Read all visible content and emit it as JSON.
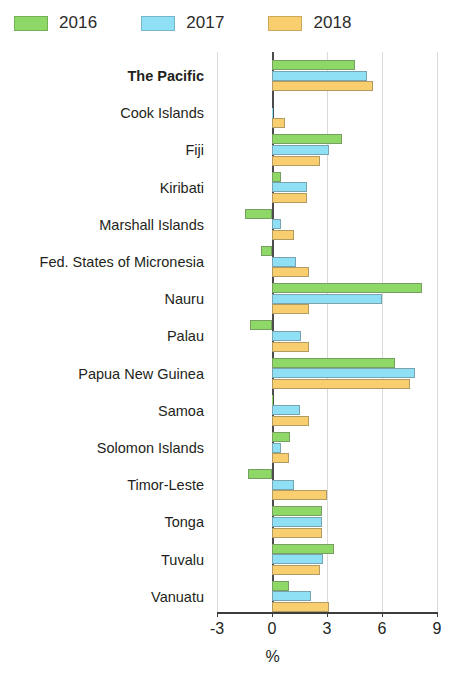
{
  "chart_data": {
    "type": "bar",
    "orientation": "horizontal",
    "title": "",
    "subtitle": "",
    "xlabel": "%",
    "ylabel": "",
    "xlim": [
      -3,
      9
    ],
    "xticks": [
      -3,
      0,
      3,
      6,
      9
    ],
    "xtick_labels": [
      "-3",
      "0",
      "3",
      "6",
      "9"
    ],
    "grid": true,
    "grid_axis": "x",
    "legend_position": "top-left",
    "emphasized_category": "The Pacific",
    "categories": [
      "The Pacific",
      "Cook Islands",
      "Fiji",
      "Kiribati",
      "Marshall Islands",
      "Fed. States of Micronesia",
      "Nauru",
      "Palau",
      "Papua New Guinea",
      "Samoa",
      "Solomon Islands",
      "Timor-Leste",
      "Tonga",
      "Tuvalu",
      "Vanuatu"
    ],
    "series": [
      {
        "name": "2016",
        "color": "#8DD867",
        "values": [
          4.5,
          0.0,
          3.8,
          0.5,
          -1.5,
          -0.6,
          8.2,
          -1.2,
          6.7,
          0.05,
          1.0,
          -1.3,
          2.7,
          3.4,
          0.9
        ]
      },
      {
        "name": "2017",
        "color": "#8FE0F5",
        "values": [
          5.2,
          0.05,
          3.1,
          1.9,
          0.5,
          1.3,
          6.0,
          1.6,
          7.8,
          1.5,
          0.5,
          1.2,
          2.7,
          2.8,
          2.1
        ]
      },
      {
        "name": "2018",
        "color": "#F9CE6E",
        "values": [
          5.5,
          0.7,
          2.6,
          1.9,
          1.2,
          2.0,
          2.0,
          2.0,
          7.5,
          2.0,
          0.9,
          3.0,
          2.7,
          2.6,
          3.1
        ]
      }
    ]
  },
  "legend": {
    "items": [
      {
        "label": "2016",
        "color": "#8DD867"
      },
      {
        "label": "2017",
        "color": "#8FE0F5"
      },
      {
        "label": "2018",
        "color": "#F9CE6E"
      }
    ]
  },
  "axis": {
    "x_title": "%"
  }
}
